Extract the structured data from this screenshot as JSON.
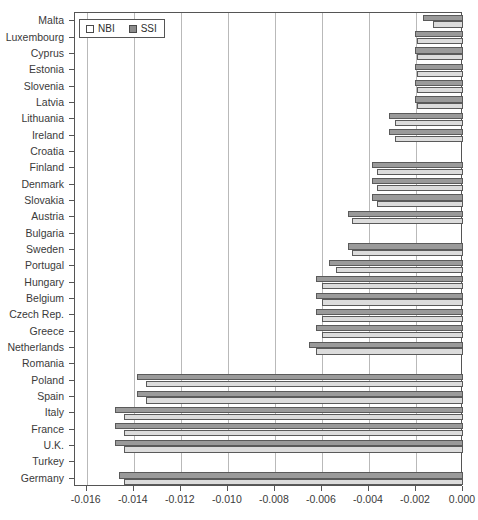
{
  "chart_data": {
    "type": "bar",
    "orientation": "horizontal",
    "title": "",
    "xlabel": "",
    "ylabel": "",
    "xlim": [
      -0.0165,
      0.0
    ],
    "xticks": [
      "-0.016",
      "-0.014",
      "-0.012",
      "-0.010",
      "-0.008",
      "-0.006",
      "-0.004",
      "-0.002",
      "0.000"
    ],
    "xtick_values": [
      -0.016,
      -0.014,
      -0.012,
      -0.01,
      -0.008,
      -0.006,
      -0.004,
      -0.002,
      0.0
    ],
    "grid": "vertical",
    "legend_position": "top-left",
    "categories": [
      "Malta",
      "Luxembourg",
      "Cyprus",
      "Estonia",
      "Slovenia",
      "Latvia",
      "Lithuania",
      "Ireland",
      "Croatia",
      "Finland",
      "Denmark",
      "Slovakia",
      "Austria",
      "Bulgaria",
      "Sweden",
      "Portugal",
      "Hungary",
      "Belgium",
      "Czech Rep.",
      "Greece",
      "Netherlands",
      "Romania",
      "Poland",
      "Spain",
      "Italy",
      "France",
      "U.K.",
      "Turkey",
      "Germany"
    ],
    "series": [
      {
        "name": "NBI",
        "color": "#dcdcdc",
        "values": [
          -0.00128,
          -0.00195,
          -0.00195,
          -0.00195,
          -0.00195,
          -0.00195,
          -0.0029,
          -0.0029,
          0.0,
          -0.00365,
          -0.00365,
          -0.00365,
          -0.0047,
          0.0,
          -0.0047,
          -0.0054,
          -0.006,
          -0.006,
          -0.006,
          -0.006,
          -0.00625,
          0.0,
          -0.0135,
          -0.0135,
          -0.0144,
          -0.0144,
          -0.0144,
          0.0,
          -0.0144
        ]
      },
      {
        "name": "SSI",
        "color": "#9a9a9a",
        "values": [
          -0.00172,
          -0.00205,
          -0.00205,
          -0.00205,
          -0.00205,
          -0.00205,
          -0.00315,
          -0.00315,
          0.0,
          -0.00385,
          -0.00385,
          -0.00385,
          -0.0049,
          0.0,
          -0.0049,
          -0.0057,
          -0.00625,
          -0.00625,
          -0.00625,
          -0.00625,
          -0.00655,
          0.0,
          -0.01385,
          -0.01385,
          -0.0148,
          -0.0148,
          -0.0148,
          0.0,
          -0.01465
        ]
      }
    ]
  },
  "legend": {
    "entries": [
      {
        "label": "NBI",
        "swatch": "nbi"
      },
      {
        "label": "SSI",
        "swatch": "ssi"
      }
    ]
  }
}
